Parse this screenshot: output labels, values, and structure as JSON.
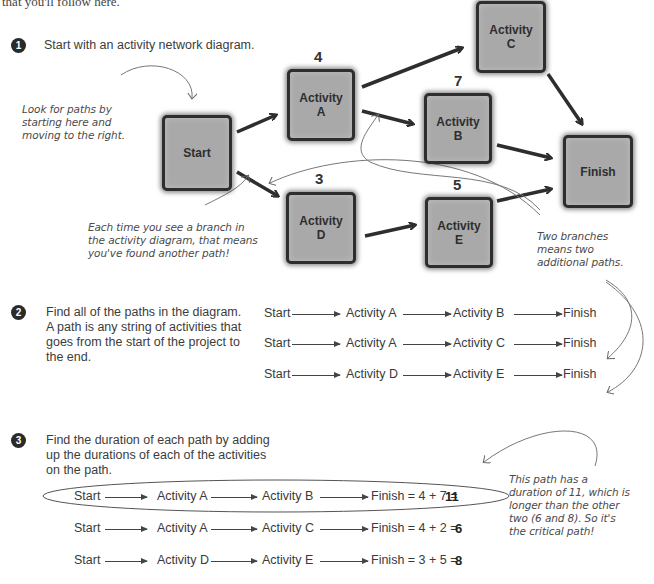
{
  "header": {
    "intro_text": "that you'll follow here."
  },
  "steps": [
    {
      "number": "1",
      "text": "Start with an activity network diagram."
    },
    {
      "number": "2",
      "text": "Find all of the paths in the diagram. A path is any string of activities that goes from the start of the project to the end."
    },
    {
      "number": "3",
      "text": "Find the duration of each path by adding up the durations of each of the activities on the path."
    }
  ],
  "diagram": {
    "nodes": {
      "start": {
        "label": "Start",
        "duration": ""
      },
      "a": {
        "label": "Activity\nA",
        "duration": "4"
      },
      "b": {
        "label": "Activity\nB",
        "duration": "7"
      },
      "c": {
        "label": "Activity\nC",
        "duration": ""
      },
      "d": {
        "label": "Activity\nD",
        "duration": "3"
      },
      "e": {
        "label": "Activity\nE",
        "duration": "5"
      },
      "finish": {
        "label": "Finish",
        "duration": ""
      }
    },
    "edges": [
      [
        "Start",
        "Activity A"
      ],
      [
        "Start",
        "Activity D"
      ],
      [
        "Activity A",
        "Activity C"
      ],
      [
        "Activity A",
        "Activity B"
      ],
      [
        "Activity B",
        "Finish"
      ],
      [
        "Activity C",
        "Finish"
      ],
      [
        "Activity D",
        "Activity E"
      ],
      [
        "Activity E",
        "Finish"
      ]
    ]
  },
  "annotations": {
    "look_for_paths": "Look for paths by\nstarting here and\nmoving to the right.",
    "each_branch": "Each time you see a branch in\nthe activity diagram, that means\nyou've found another path!",
    "two_branches": "Two branches\nmeans two\nadditional paths.",
    "critical": "This path has a\nduration of 11, which is\nlonger than the other\ntwo (6 and 8). So it's\nthe critical path!"
  },
  "paths": [
    {
      "nodes": [
        "Start",
        "Activity A",
        "Activity B",
        "Finish"
      ]
    },
    {
      "nodes": [
        "Start",
        "Activity A",
        "Activity C",
        "Finish"
      ]
    },
    {
      "nodes": [
        "Start",
        "Activity D",
        "Activity E",
        "Finish"
      ]
    }
  ],
  "durations": [
    {
      "nodes": [
        "Start",
        "Activity A",
        "Activity B"
      ],
      "finish_expr": "Finish = 4 + 7 = ",
      "total": "11",
      "critical": true
    },
    {
      "nodes": [
        "Start",
        "Activity A",
        "Activity C"
      ],
      "finish_expr": "Finish = 4 + 2 = ",
      "total": "6",
      "critical": false
    },
    {
      "nodes": [
        "Start",
        "Activity D",
        "Activity E"
      ],
      "finish_expr": "Finish = 3 + 5 = ",
      "total": "8",
      "critical": false
    }
  ]
}
